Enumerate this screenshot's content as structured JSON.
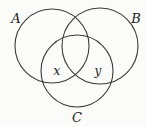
{
  "diagram": {
    "type": "venn",
    "sets": [
      {
        "id": "A",
        "label": "A",
        "cx": 52,
        "cy": 46,
        "r": 37,
        "label_x": 16,
        "label_y": 23
      },
      {
        "id": "B",
        "label": "B",
        "cx": 100,
        "cy": 46,
        "r": 38,
        "label_x": 136,
        "label_y": 23
      },
      {
        "id": "C",
        "label": "C",
        "cx": 77,
        "cy": 71,
        "r": 36,
        "label_x": 77,
        "label_y": 122
      }
    ],
    "regions": [
      {
        "id": "x",
        "label": "x",
        "in": [
          "A",
          "C"
        ],
        "not_in": [
          "B"
        ],
        "label_x": 57,
        "label_y": 75
      },
      {
        "id": "y",
        "label": "y",
        "in": [
          "B",
          "C"
        ],
        "not_in": [
          "A"
        ],
        "label_x": 98,
        "label_y": 75
      }
    ],
    "stroke_color": "#3a3a3a",
    "background": "#fbfbf9"
  }
}
